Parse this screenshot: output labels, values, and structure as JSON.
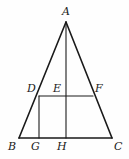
{
  "figure": {
    "background_color": "#fefefe",
    "stroke_color": "#1a1a1a",
    "label_color": "#1a1a1a",
    "canvas": {
      "width": 129,
      "height": 159
    }
  },
  "points": {
    "A": {
      "label": "A",
      "x": 66,
      "y": 22,
      "label_x": 62,
      "label_y": 6
    },
    "B": {
      "label": "B",
      "x": 19,
      "y": 138,
      "label_x": 8,
      "label_y": 141
    },
    "C": {
      "label": "C",
      "x": 112,
      "y": 138,
      "label_x": 114,
      "label_y": 141
    },
    "D": {
      "label": "D",
      "x": 39,
      "y": 96,
      "label_x": 27,
      "label_y": 83
    },
    "E": {
      "label": "E",
      "x": 66,
      "y": 96,
      "label_x": 53,
      "label_y": 83
    },
    "F": {
      "label": "F",
      "x": 93,
      "y": 96,
      "label_x": 95,
      "label_y": 83
    },
    "G": {
      "label": "G",
      "x": 39,
      "y": 138,
      "label_x": 31,
      "label_y": 141
    },
    "H": {
      "label": "H",
      "x": 66,
      "y": 138,
      "label_x": 57,
      "label_y": 141
    }
  },
  "segments": [
    {
      "name": "side-AB",
      "from": "A",
      "to": "B",
      "x1": 66,
      "y1": 22,
      "x2": 19,
      "y2": 138,
      "width": 1.6
    },
    {
      "name": "side-AC",
      "from": "A",
      "to": "C",
      "x1": 66,
      "y1": 22,
      "x2": 112,
      "y2": 138,
      "width": 1.6
    },
    {
      "name": "base-BC",
      "from": "B",
      "to": "C",
      "x1": 19,
      "y1": 138,
      "x2": 112,
      "y2": 138,
      "width": 1.6
    },
    {
      "name": "altitude-AH",
      "from": "A",
      "to": "H",
      "x1": 66,
      "y1": 22,
      "x2": 66,
      "y2": 138,
      "width": 1.1
    },
    {
      "name": "midsegment-DF",
      "from": "D",
      "to": "F",
      "x1": 39,
      "y1": 96,
      "x2": 93,
      "y2": 96,
      "width": 1.1
    },
    {
      "name": "perpendicular-DG",
      "from": "D",
      "to": "G",
      "x1": 39,
      "y1": 96,
      "x2": 39,
      "y2": 138,
      "width": 1.1
    }
  ],
  "label_order": [
    "A",
    "B",
    "C",
    "D",
    "E",
    "F",
    "G",
    "H"
  ]
}
